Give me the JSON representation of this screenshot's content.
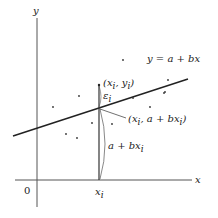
{
  "diagram": {
    "colors": {
      "axis": "#555555",
      "line": "#222222",
      "point": "#333333",
      "text": "#222222"
    },
    "axes": {
      "x_label": "x",
      "y_label": "y",
      "origin_label": "0",
      "xi_tick_label": "x",
      "xi_tick_sub": "i"
    },
    "regression_line": {
      "label": "y = a + bx"
    },
    "highlighted_point": {
      "label_open": "(x",
      "label_sub1": "i",
      "label_mid": ", y",
      "label_sub2": "i",
      "label_close": ")"
    },
    "residual": {
      "label": "ε",
      "sub": "i"
    },
    "fitted_point": {
      "label_open": "(x",
      "label_sub1": "i",
      "label_mid": ", a + bx",
      "label_sub2": "i",
      "label_close": ")"
    },
    "fitted_height": {
      "label": "a + bx",
      "sub": "i"
    }
  },
  "scatter_points": [
    [
      123,
      60
    ],
    [
      168,
      80
    ],
    [
      165,
      92
    ],
    [
      133,
      98
    ],
    [
      150,
      107
    ],
    [
      164,
      93
    ],
    [
      112,
      124
    ],
    [
      53,
      107
    ],
    [
      79,
      96
    ],
    [
      92,
      123
    ],
    [
      66,
      134
    ],
    [
      77,
      138
    ]
  ]
}
